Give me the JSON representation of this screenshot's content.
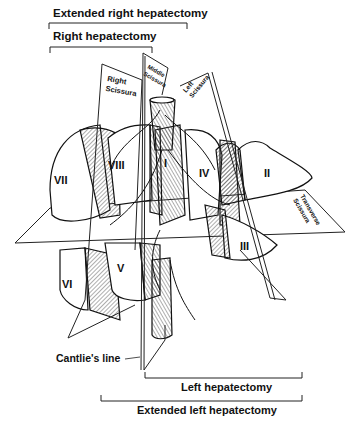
{
  "diagram": {
    "top_labels": {
      "extended_right": "Extended right hepatectomy",
      "right": "Right hepatectomy"
    },
    "bottom_labels": {
      "cantlie": "Cantlie's line",
      "left": "Left hepatectomy",
      "extended_left": "Extended left hepatectomy"
    },
    "planes": {
      "right_scissura": [
        "Right",
        "Scissura"
      ],
      "middle_scissura": [
        "Middle",
        "Scissura"
      ],
      "left_scissura": [
        "Left",
        "Scissura"
      ],
      "transverse_scissura": [
        "Transverse",
        "Scissura"
      ]
    },
    "segments": {
      "s1": "I",
      "s2": "II",
      "s3": "III",
      "s4": "IV",
      "s5": "V",
      "s6": "VI",
      "s7": "VII",
      "s8": "VIII"
    }
  }
}
